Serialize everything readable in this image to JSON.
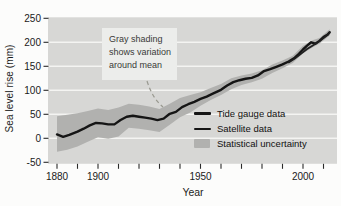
{
  "figure": {
    "y_axis_title": "Sea level rise (mm)",
    "x_axis_title": "Year",
    "annotation": {
      "lines": [
        "Gray shading",
        "shows variation",
        "around mean"
      ]
    },
    "legend": {
      "items": [
        {
          "label": "Tide gauge data",
          "swatch": "line"
        },
        {
          "label": "Satellite data",
          "swatch": "line-thin"
        },
        {
          "label": "Statistical uncertainty",
          "swatch": "patch"
        }
      ]
    }
  },
  "chart_data": {
    "type": "line",
    "title": "",
    "xlabel": "Year",
    "ylabel": "Sea level rise (mm)",
    "xlim": [
      1875,
      2016
    ],
    "ylim": [
      -50,
      250
    ],
    "grid": "horizontal-white",
    "legend_position": "inside-bottom-right",
    "y_ticks": [
      -50,
      0,
      50,
      100,
      150,
      200,
      250
    ],
    "x_ticks_minor": [
      1880,
      1890,
      1900,
      1910,
      1920,
      1930,
      1940,
      1950,
      1960,
      1970,
      1980,
      1990,
      2000,
      2010
    ],
    "x_ticks_labeled": [
      1880,
      1900,
      1950,
      2000
    ],
    "series": [
      {
        "name": "Tide gauge data",
        "color": "#151515",
        "width": 2.4,
        "points": [
          [
            1880,
            8
          ],
          [
            1883,
            3
          ],
          [
            1886,
            7
          ],
          [
            1890,
            14
          ],
          [
            1893,
            20
          ],
          [
            1896,
            27
          ],
          [
            1899,
            32
          ],
          [
            1902,
            31
          ],
          [
            1905,
            29
          ],
          [
            1908,
            29
          ],
          [
            1911,
            38
          ],
          [
            1914,
            45
          ],
          [
            1917,
            47
          ],
          [
            1920,
            45
          ],
          [
            1923,
            43
          ],
          [
            1926,
            41
          ],
          [
            1929,
            38
          ],
          [
            1932,
            41
          ],
          [
            1935,
            51
          ],
          [
            1938,
            55
          ],
          [
            1941,
            65
          ],
          [
            1944,
            71
          ],
          [
            1947,
            76
          ],
          [
            1950,
            82
          ],
          [
            1953,
            87
          ],
          [
            1956,
            93
          ],
          [
            1960,
            101
          ],
          [
            1963,
            110
          ],
          [
            1966,
            117
          ],
          [
            1969,
            121
          ],
          [
            1972,
            124
          ],
          [
            1975,
            126
          ],
          [
            1978,
            131
          ],
          [
            1981,
            140
          ],
          [
            1984,
            144
          ],
          [
            1987,
            149
          ],
          [
            1990,
            154
          ],
          [
            1993,
            160
          ],
          [
            1996,
            168
          ],
          [
            1998,
            176
          ],
          [
            2000,
            185
          ],
          [
            2002,
            193
          ],
          [
            2004,
            200
          ],
          [
            2006,
            197
          ],
          [
            2008,
            203
          ],
          [
            2010,
            211
          ],
          [
            2012,
            216
          ],
          [
            2013,
            221
          ]
        ]
      },
      {
        "name": "Satellite data",
        "color": "#202020",
        "width": 1.7,
        "points": [
          [
            1993,
            158
          ],
          [
            1996,
            166
          ],
          [
            1999,
            176
          ],
          [
            2002,
            186
          ],
          [
            2005,
            194
          ],
          [
            2008,
            202
          ],
          [
            2011,
            212
          ],
          [
            2013,
            220
          ]
        ]
      }
    ],
    "band": {
      "name": "Statistical uncertainty",
      "color": "#b1b1af",
      "points": [
        [
          1880,
          -28,
          46
        ],
        [
          1885,
          -24,
          49
        ],
        [
          1890,
          -17,
          52
        ],
        [
          1895,
          -7,
          57
        ],
        [
          1900,
          2,
          62
        ],
        [
          1905,
          -1,
          59
        ],
        [
          1910,
          4,
          64
        ],
        [
          1915,
          22,
          72
        ],
        [
          1920,
          20,
          70
        ],
        [
          1925,
          17,
          66
        ],
        [
          1930,
          13,
          61
        ],
        [
          1935,
          28,
          72
        ],
        [
          1940,
          44,
          84
        ],
        [
          1945,
          54,
          90
        ],
        [
          1950,
          68,
          96
        ],
        [
          1955,
          80,
          105
        ],
        [
          1960,
          90,
          113
        ],
        [
          1965,
          102,
          125
        ],
        [
          1970,
          111,
          131
        ],
        [
          1975,
          117,
          135
        ],
        [
          1980,
          124,
          142
        ],
        [
          1985,
          136,
          154
        ],
        [
          1990,
          146,
          162
        ],
        [
          1995,
          157,
          172
        ],
        [
          2000,
          177,
          193
        ],
        [
          2005,
          190,
          205
        ],
        [
          2008,
          197,
          209
        ],
        [
          2013,
          214,
          227
        ]
      ]
    },
    "colors": {
      "plot_background": "#d7d7d5",
      "gridline": "#f4f4f2",
      "tick": "#2a2a2a",
      "tick_label": "#1a1a1a",
      "annotation_leader": "#98988f"
    }
  }
}
